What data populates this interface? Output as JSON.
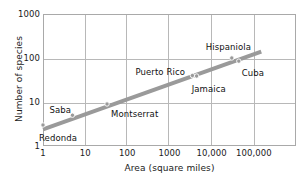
{
  "chart_data": {
    "type": "scatter",
    "title": "",
    "subtitle": "",
    "xlabel": "Area (square miles)",
    "ylabel": "Number of species",
    "xscale": "log",
    "yscale": "log",
    "xlim": [
      1,
      1000000
    ],
    "ylim": [
      1,
      1000
    ],
    "grid": true,
    "legend": "none",
    "xticks": [
      {
        "value": 1,
        "label": "1"
      },
      {
        "value": 10,
        "label": "10"
      },
      {
        "value": 100,
        "label": "100"
      },
      {
        "value": 1000,
        "label": "1000"
      },
      {
        "value": 10000,
        "label": "10,000"
      },
      {
        "value": 100000,
        "label": "100,000"
      }
    ],
    "yticks": [
      {
        "value": 1,
        "label": "1"
      },
      {
        "value": 10,
        "label": "10"
      },
      {
        "value": 100,
        "label": "100"
      },
      {
        "value": 1000,
        "label": "1000"
      }
    ],
    "points": [
      {
        "name": "Redonda",
        "x": 1,
        "y": 3,
        "label": "Redonda",
        "label_dx": -4,
        "label_dy": 14
      },
      {
        "name": "Saba",
        "x": 5,
        "y": 5,
        "label": "Saba",
        "label_dx": -23,
        "label_dy": -4
      },
      {
        "name": "Montserrat",
        "x": 33,
        "y": 9,
        "label": "Montserrat",
        "label_dx": 4,
        "label_dy": 11
      },
      {
        "name": "Puerto Rico",
        "x": 3500,
        "y": 40,
        "label": "Puerto Rico",
        "label_dx": -57,
        "label_dy": -3
      },
      {
        "name": "Jamaica",
        "x": 4400,
        "y": 39,
        "label": "Jamaica",
        "label_dx": -5,
        "label_dy": 14
      },
      {
        "name": "Hispaniola",
        "x": 30000,
        "y": 100,
        "label": "Hispaniola",
        "label_dx": -26,
        "label_dy": -10
      },
      {
        "name": "Cuba",
        "x": 44000,
        "y": 85,
        "label": "Cuba",
        "label_dx": 3,
        "label_dy": 13
      }
    ],
    "trendline": {
      "label": "species-area regression line",
      "x_start": 1,
      "y_start": 2.4,
      "x_end": 150000,
      "y_end": 140,
      "color": "#9a9a9a",
      "width": 4
    },
    "colors": {
      "marker": "#9a9a9a",
      "line": "#9a9a9a",
      "grid": "#b8b8b8",
      "frame": "#a9a9a9",
      "text": "#1a1a1a",
      "background": "#ffffff"
    }
  }
}
